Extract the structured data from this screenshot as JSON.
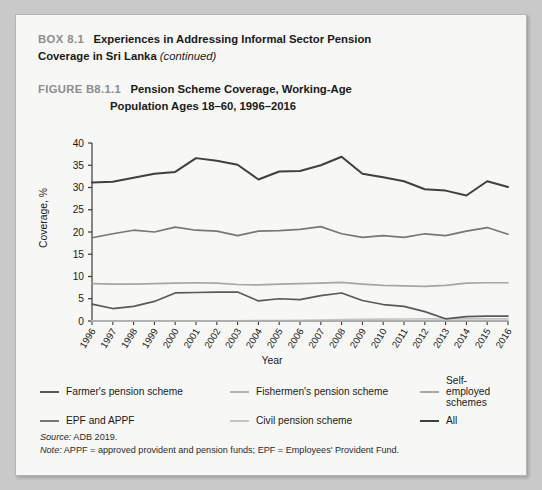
{
  "box": {
    "tag": "BOX 8.1",
    "title": "Experiences in Addressing Informal Sector Pension",
    "title_line2": "Coverage in Sri Lanka",
    "continued": "(continued)"
  },
  "figure": {
    "tag": "FIGURE B8.1.1",
    "title_line1": "Pension Scheme Coverage, Working-Age",
    "title_line2": "Population Ages 18–60, 1996–2016"
  },
  "axes": {
    "ylabel": "Coverage, %",
    "xlabel": "Year",
    "yticks": [
      "0",
      "5",
      "10",
      "15",
      "20",
      "25",
      "30",
      "35",
      "40"
    ]
  },
  "legend": {
    "row1": [
      {
        "label": "Farmer's pension scheme",
        "color": "#595959"
      },
      {
        "label": "Fishermen's pension scheme",
        "color": "#b0b0b0"
      },
      {
        "label": "Self-employed schemes",
        "color": "#a6a6a6"
      }
    ],
    "row2": [
      {
        "label": "EPF and APPF",
        "color": "#777777"
      },
      {
        "label": "Civil pension scheme",
        "color": "#c4c4c4"
      },
      {
        "label": "All",
        "color": "#3f3f3f"
      }
    ]
  },
  "notes": {
    "source_label": "Source:",
    "source_text": " ADB 2019.",
    "note_label": "Note:",
    "note_text": " APPF = approved provident and pension funds; EPF = Employees' Provident Fund."
  },
  "chart_data": {
    "type": "line",
    "title": "Pension Scheme Coverage, Working-Age Population Ages 18–60, 1996–2016",
    "xlabel": "Year",
    "ylabel": "Coverage, %",
    "ylim": [
      0,
      40
    ],
    "ytick_step": 5,
    "grid": false,
    "legend_position": "bottom",
    "x": [
      1996,
      1997,
      1998,
      1999,
      2000,
      2001,
      2002,
      2003,
      2004,
      2005,
      2006,
      2007,
      2008,
      2009,
      2010,
      2011,
      2012,
      2013,
      2014,
      2015,
      2016
    ],
    "series": [
      {
        "name": "All",
        "color": "#3f3f3f",
        "values": [
          31.1,
          31.3,
          32.2,
          33.1,
          33.5,
          36.6,
          36.0,
          35.1,
          31.8,
          33.6,
          33.7,
          35.0,
          36.9,
          33.1,
          32.3,
          31.4,
          29.6,
          29.3,
          28.2,
          31.4,
          30.1
        ]
      },
      {
        "name": "EPF and APPF",
        "color": "#777777",
        "values": [
          18.7,
          19.6,
          20.4,
          20.0,
          21.1,
          20.4,
          20.2,
          19.2,
          20.2,
          20.3,
          20.6,
          21.2,
          19.6,
          18.8,
          19.2,
          18.8,
          19.6,
          19.2,
          20.2,
          21.0,
          19.5
        ]
      },
      {
        "name": "Self-employed schemes",
        "color": "#a6a6a6",
        "values": [
          8.4,
          8.3,
          8.3,
          8.4,
          8.5,
          8.6,
          8.5,
          8.2,
          8.1,
          8.3,
          8.4,
          8.5,
          8.7,
          8.3,
          8.0,
          7.9,
          7.8,
          8.0,
          8.5,
          8.6,
          8.6
        ]
      },
      {
        "name": "Farmer's pension scheme",
        "color": "#595959",
        "values": [
          3.8,
          2.8,
          3.3,
          4.4,
          6.3,
          6.4,
          6.5,
          6.5,
          4.5,
          5.0,
          4.8,
          5.7,
          6.3,
          4.6,
          3.7,
          3.3,
          2.1,
          0.5,
          1.0,
          1.1,
          1.1
        ]
      },
      {
        "name": "Civil pension scheme",
        "color": "#c4c4c4",
        "values": [
          0.05,
          0.05,
          0.05,
          0.05,
          0.05,
          0.05,
          0.06,
          0.06,
          0.08,
          0.1,
          0.15,
          0.2,
          0.3,
          0.35,
          0.4,
          0.45,
          0.5,
          0.5,
          0.5,
          0.5,
          0.5
        ]
      },
      {
        "name": "Fishermen's pension scheme",
        "color": "#b0b0b0",
        "values": [
          0.02,
          0.02,
          0.02,
          0.02,
          0.02,
          0.02,
          0.02,
          0.02,
          0.02,
          0.02,
          0.03,
          0.03,
          0.03,
          0.03,
          0.03,
          0.03,
          0.03,
          0.03,
          0.03,
          0.03,
          0.03
        ]
      }
    ]
  }
}
